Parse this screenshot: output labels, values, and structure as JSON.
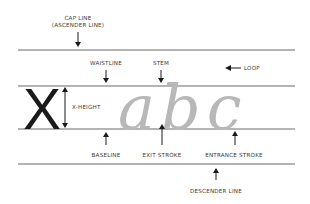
{
  "diagram": {
    "demo_letters": "abc",
    "reference_letter": "X",
    "colors": {
      "guide_lines": "#b4b4b4",
      "script_letters": "#b8b8b8",
      "labels": "#3a3a3a",
      "arrows": "#1a1a1a"
    },
    "labels": {
      "cap_line_1": "CAP LINE",
      "cap_line_2": "(ASCENDER LINE)",
      "waistline": "WAISTLINE",
      "stem": "STEM",
      "loop": "LOOP",
      "x_height": "X-HEIGHT",
      "baseline": "BASELINE",
      "exit_stroke": "EXIT STROKE",
      "entrance_stroke": "ENTRANCE STROKE",
      "descender_line": "DESCENDER LINE"
    }
  }
}
